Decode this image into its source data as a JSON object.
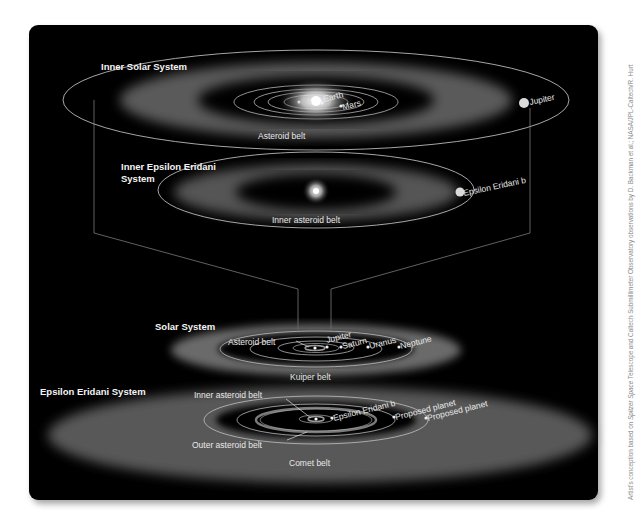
{
  "figure": {
    "background": "#000000",
    "sections": {
      "inner_solar_system": {
        "title": "Inner Solar System",
        "labels": {
          "earth": "Earth",
          "mars": "Mars",
          "jupiter": "Jupiter",
          "belt": "Asteroid belt"
        }
      },
      "inner_epsilon_eridani": {
        "title_line1": "Inner Epsilon Eridani",
        "title_line2": "System",
        "labels": {
          "planet": "Epsilon Eridani b",
          "belt": "Inner asteroid belt"
        }
      },
      "solar_system": {
        "title": "Solar System",
        "labels": {
          "asteroid_belt": "Asteroid belt",
          "jupiter": "Jupiter",
          "saturn": "Saturn",
          "uranus": "Uranus",
          "neptune": "Neptune",
          "kuiper": "Kuiper belt"
        }
      },
      "epsilon_eridani_system": {
        "title": "Epsilon Eridani System",
        "labels": {
          "inner_belt": "Inner asteroid belt",
          "planet_b": "Epsilon Eridani b",
          "proposed1": "Proposed planet",
          "proposed2": "Proposed planet",
          "outer_belt": "Outer asteroid belt",
          "comet_belt": "Comet belt"
        }
      }
    },
    "credit": {
      "prefix": "Artist's conception based on ",
      "telescope": "Spitzer Space",
      "suffix": " Telescope and Caltech Submillimeter Observatory observations by D. Backman et al.; NASA/JPL-Caltech/R. Hurt"
    }
  }
}
